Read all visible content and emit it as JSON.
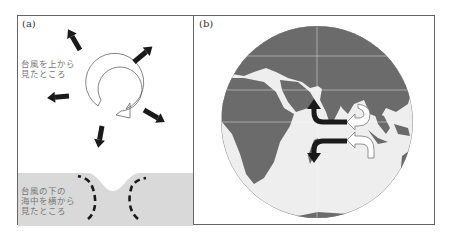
{
  "figure": {
    "panel_a": {
      "label": "(a)",
      "caption_top": "台風を上から\n見たところ",
      "caption_bottom": "台風の下の\n海中を横から\n見たところ"
    },
    "panel_b": {
      "label": "(b)"
    }
  },
  "icons": {
    "rotation": "counterclockwise-hollow-arrow-icon",
    "outflow": "black-arrow-icon",
    "upwelling": "dashed-arc-arrow-icon",
    "current_dark": "black-curved-arrow-icon",
    "current_light": "white-curved-arrow-icon"
  },
  "colors": {
    "frame": "#666666",
    "water": "#d9d9d9",
    "land": "#6b6b6b",
    "ocean": "#eeeeee",
    "arrow": "#1a1a1a",
    "caption": "#777777"
  }
}
